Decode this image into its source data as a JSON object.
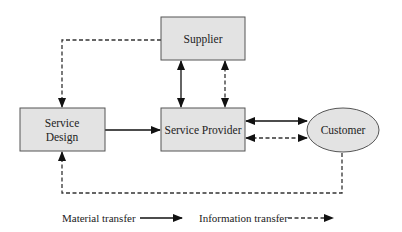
{
  "diagram": {
    "nodes": [
      {
        "id": "supplier",
        "shape": "rect",
        "label_lines": [
          "Supplier"
        ],
        "fill": "#e3e3e3"
      },
      {
        "id": "service_design",
        "shape": "rect",
        "label_lines": [
          "Service",
          "Design"
        ],
        "fill": "#e3e3e3"
      },
      {
        "id": "service_provider",
        "shape": "rect",
        "label_lines": [
          "Service Provider"
        ],
        "fill": "#e3e3e3"
      },
      {
        "id": "customer",
        "shape": "ellipse",
        "label_lines": [
          "Customer"
        ],
        "fill": "#e3e3e3"
      }
    ],
    "edges": [
      {
        "from": "supplier",
        "to": "service_design",
        "type": "information",
        "direction": "one-way"
      },
      {
        "from": "supplier",
        "to": "service_provider",
        "type": "material",
        "direction": "two-way"
      },
      {
        "from": "supplier",
        "to": "service_provider",
        "type": "information",
        "direction": "two-way"
      },
      {
        "from": "service_design",
        "to": "service_provider",
        "type": "material",
        "direction": "one-way"
      },
      {
        "from": "service_provider",
        "to": "customer",
        "type": "material",
        "direction": "two-way"
      },
      {
        "from": "service_provider",
        "to": "customer",
        "type": "information",
        "direction": "two-way"
      },
      {
        "from": "customer",
        "to": "service_design",
        "type": "information",
        "direction": "one-way"
      }
    ]
  },
  "labels": {
    "supplier": "Supplier",
    "service_design_line1": "Service",
    "service_design_line2": "Design",
    "service_provider": "Service Provider",
    "customer": "Customer"
  },
  "legend": {
    "material": "Material transfer",
    "information": "Information transfer"
  },
  "colors": {
    "box_fill": "#e3e3e3",
    "stroke": "#333333",
    "text": "#222222"
  }
}
